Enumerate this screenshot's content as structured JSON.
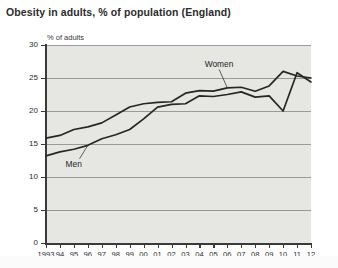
{
  "chart_data": {
    "type": "line",
    "title": "Obesity in adults, % of population (England)",
    "ylabel": "% of adults",
    "xlabel": "",
    "ylim": [
      0,
      30
    ],
    "ytick_step": 5,
    "yticks": [
      "0",
      "5",
      "10",
      "15",
      "20",
      "25",
      "30"
    ],
    "grid": true,
    "legend_position": "inline-annotations",
    "x": [
      1993,
      1994,
      1995,
      1996,
      1997,
      1998,
      1999,
      2000,
      2001,
      2002,
      2003,
      2004,
      2005,
      2006,
      2007,
      2008,
      2009,
      2010,
      2011,
      2012
    ],
    "xtick_labels": [
      "1993",
      "94",
      "95",
      "96",
      "97",
      "98",
      "99",
      "00",
      "01",
      "02",
      "03",
      "04",
      "05",
      "06",
      "07",
      "08",
      "09",
      "10",
      "11",
      "12"
    ],
    "series": [
      {
        "name": "Women",
        "values": [
          15.9,
          16.3,
          17.2,
          17.6,
          18.2,
          19.4,
          20.6,
          21.1,
          21.3,
          21.4,
          22.7,
          23.1,
          23.0,
          23.5,
          23.6,
          23.0,
          23.8,
          26.0,
          25.3,
          25.0
        ]
      },
      {
        "name": "Men",
        "values": [
          13.2,
          13.8,
          14.2,
          14.8,
          15.8,
          16.4,
          17.2,
          18.8,
          20.6,
          21.0,
          21.1,
          22.3,
          22.2,
          22.5,
          22.9,
          22.1,
          22.3,
          20.0,
          25.8,
          24.4
        ]
      }
    ],
    "annotations": [
      {
        "label": "Men",
        "x": 1994.9,
        "y": 12.0
      },
      {
        "label": "Women",
        "x": 2005.2,
        "y": 27.2
      }
    ],
    "colors": {
      "line": "#262626",
      "plot_background": "#e6e6e3",
      "gridline": "#9a9a9a",
      "axis": "#3a3a3a",
      "title": "#2b2b2b"
    }
  }
}
